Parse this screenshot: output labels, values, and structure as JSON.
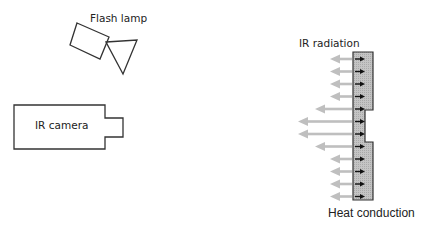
{
  "diagram": {
    "labels": {
      "flash_lamp": "Flash lamp",
      "ir_camera": "IR camera",
      "ir_radiation": "IR radiation",
      "heat_conduction": "Heat conduction"
    },
    "colors": {
      "outline": "#333333",
      "sample_fill": "#bdbdbd",
      "radiation_arrow": "#bfbfbf",
      "conduction_arrow": "#111111"
    },
    "arrows": {
      "radiation_count": 12,
      "conduction_count": 12,
      "long_radiation_indices": [
        4,
        5,
        6,
        7
      ]
    }
  }
}
